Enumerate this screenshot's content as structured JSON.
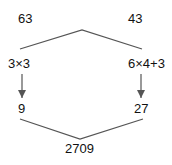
{
  "diagram": {
    "top_left": "63",
    "top_right": "43",
    "mid_left": "3×3",
    "mid_right": "6×4+3",
    "bottom_left": "9",
    "bottom_right": "27",
    "result": "2709"
  },
  "colors": {
    "line": "#555555",
    "text": "#111111"
  }
}
